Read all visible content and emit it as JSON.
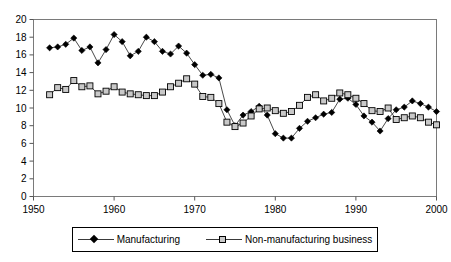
{
  "chart_data": {
    "type": "line",
    "title": "",
    "xlabel": "",
    "ylabel": "",
    "xlim": [
      1950,
      2000
    ],
    "ylim": [
      0,
      20
    ],
    "grid": false,
    "legend_position": "bottom",
    "xticks": [
      "1950",
      "1960",
      "1970",
      "1980",
      "1990",
      "2000"
    ],
    "yticks": [
      "0",
      "2",
      "4",
      "6",
      "8",
      "10",
      "12",
      "14",
      "16",
      "18",
      "20"
    ],
    "x": [
      1952,
      1953,
      1954,
      1955,
      1956,
      1957,
      1958,
      1959,
      1960,
      1961,
      1962,
      1963,
      1964,
      1965,
      1966,
      1967,
      1968,
      1969,
      1970,
      1971,
      1972,
      1973,
      1974,
      1975,
      1976,
      1977,
      1978,
      1979,
      1980,
      1981,
      1982,
      1983,
      1984,
      1985,
      1986,
      1987,
      1988,
      1989,
      1990,
      1991,
      1992,
      1993,
      1994,
      1995,
      1996,
      1997,
      1998,
      1999,
      2000
    ],
    "series": [
      {
        "name": "Manufacturing",
        "marker": "filled-diamond",
        "color": "#000000",
        "values": [
          16.8,
          16.9,
          17.2,
          17.9,
          16.5,
          16.9,
          15.1,
          16.6,
          18.3,
          17.5,
          15.9,
          16.4,
          18.0,
          17.5,
          16.4,
          16.1,
          17.0,
          16.2,
          14.9,
          13.7,
          13.8,
          13.4,
          9.8,
          8.0,
          9.2,
          9.6,
          10.2,
          9.2,
          7.1,
          6.6,
          6.6,
          7.7,
          8.5,
          8.9,
          9.3,
          9.5,
          11.0,
          11.1,
          10.4,
          9.1,
          8.4,
          7.4,
          8.8,
          9.8,
          10.1,
          10.8,
          10.5,
          10.1,
          9.6
        ]
      },
      {
        "name": "Non-manufacturing business",
        "marker": "open-square",
        "color": "#c9c9c9",
        "values": [
          11.5,
          12.3,
          12.1,
          13.1,
          12.4,
          12.5,
          11.6,
          11.9,
          12.4,
          11.8,
          11.6,
          11.5,
          11.4,
          11.4,
          11.8,
          12.4,
          12.8,
          13.3,
          12.7,
          11.3,
          11.2,
          10.5,
          8.4,
          7.9,
          8.3,
          9.1,
          9.9,
          10.0,
          9.7,
          9.4,
          9.6,
          10.3,
          11.2,
          11.5,
          10.8,
          11.1,
          11.7,
          11.5,
          11.1,
          10.5,
          9.7,
          9.6,
          10.0,
          8.7,
          8.9,
          9.1,
          8.9,
          8.4,
          8.1
        ]
      }
    ]
  },
  "legend": {
    "items": [
      {
        "label": "Manufacturing"
      },
      {
        "label": "Non-manufacturing business"
      }
    ]
  }
}
